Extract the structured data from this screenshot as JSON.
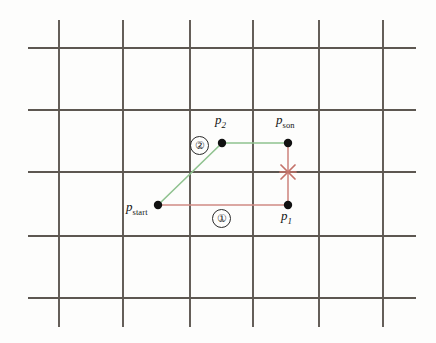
{
  "figure": {
    "background_color": "#fdfdfc",
    "width": 436,
    "height": 343
  },
  "grid": {
    "line_color": "#5d5751",
    "line_width": 1.9,
    "vertical_x": [
      59,
      123,
      190,
      253,
      319,
      383
    ],
    "vertical_y_start": 20,
    "vertical_y_end": 327,
    "horizontal_y": [
      48,
      110,
      172,
      236,
      298
    ],
    "horizontal_x_start": 28,
    "horizontal_x_end": 416
  },
  "paths": {
    "path1": {
      "label": "①",
      "color": "#d08a84",
      "line_width": 1.6,
      "points": "158,205 288,205 288,143",
      "description": "red L-shaped path from p_start through p_1 to p_son"
    },
    "path2": {
      "label": "②",
      "color": "#8fc28f",
      "line_width": 1.6,
      "points": "158,205 222,143 288,143",
      "description": "green diagonal path from p_start through p_2 to p_son"
    }
  },
  "nodes": [
    {
      "name": "p-start",
      "base": "p",
      "subscript": "start",
      "subscript_italic": false,
      "x": 158,
      "y": 205,
      "label_x": 126,
      "label_y": 200,
      "dot_radius": 4.2,
      "dot_color": "#111111"
    },
    {
      "name": "p-1",
      "base": "p",
      "subscript": "1",
      "subscript_italic": true,
      "x": 288,
      "y": 205,
      "label_x": 281,
      "label_y": 209,
      "dot_radius": 4.2,
      "dot_color": "#111111"
    },
    {
      "name": "p-2",
      "base": "p",
      "subscript": "2",
      "subscript_italic": true,
      "x": 222,
      "y": 143,
      "label_x": 215,
      "label_y": 113,
      "dot_radius": 4.2,
      "dot_color": "#111111"
    },
    {
      "name": "p-son",
      "base": "p",
      "subscript": "son",
      "subscript_italic": false,
      "x": 288,
      "y": 143,
      "label_x": 276,
      "label_y": 113,
      "dot_radius": 4.2,
      "dot_color": "#111111"
    }
  ],
  "badges": [
    {
      "name": "step-1-badge",
      "label": "①",
      "x": 212,
      "y": 209
    },
    {
      "name": "step-2-badge",
      "label": "②",
      "x": 190,
      "y": 136
    }
  ],
  "collision_marker": {
    "name": "collision-x-marker",
    "symbol": "X",
    "color": "#c4736a",
    "x": 288,
    "y": 172,
    "size": 7,
    "line_width": 1.7,
    "description": "red asterisk/cross marking the obstacle intersection on path 1"
  }
}
